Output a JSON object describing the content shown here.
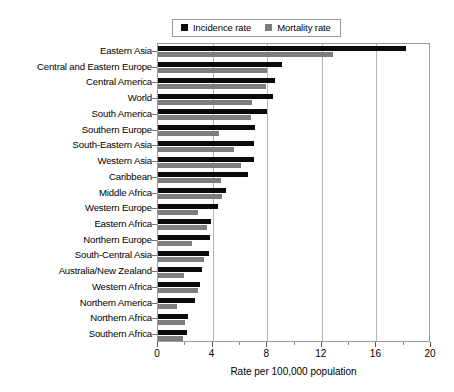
{
  "legend": {
    "position": "top-center",
    "entries": [
      {
        "label": "Incidence rate",
        "color": "#0a0a0a",
        "icon": "square-swatch"
      },
      {
        "label": "Mortality rate",
        "color": "#7d7d7d",
        "icon": "square-swatch"
      }
    ]
  },
  "axis": {
    "x_title": "Rate per 100,000 population",
    "tick_labels": [
      "0",
      "4",
      "8",
      "12",
      "16",
      "20"
    ],
    "tick_values": [
      0,
      4,
      8,
      12,
      16,
      20
    ],
    "minor_tick_values": [
      2,
      6,
      10,
      14,
      18
    ],
    "xmin": 0,
    "xmax": 20
  },
  "chart_data": {
    "type": "bar",
    "orientation": "horizontal",
    "title": "",
    "xlabel": "Rate per 100,000 population",
    "ylabel": "",
    "xlim": [
      0,
      20
    ],
    "grid": true,
    "grid_axis": "x",
    "legend_position": "top-center",
    "categories": [
      "Eastern Asia",
      "Central and Eastern Europe",
      "Central America",
      "World",
      "South America",
      "Southern Europe",
      "South-Eastern Asia",
      "Western Asia",
      "Caribbean",
      "Middle Africa",
      "Western Europe",
      "Eastern Africa",
      "Northern Europe",
      "South-Central Asia",
      "Australia/New Zealand",
      "Western Africa",
      "Northern America",
      "Northern Africa",
      "Southern Africa"
    ],
    "series": [
      {
        "name": "Incidence rate",
        "color": "#0a0a0a",
        "values": [
          18.2,
          9.1,
          8.6,
          8.4,
          8.0,
          7.1,
          7.0,
          7.0,
          6.6,
          5.0,
          4.4,
          3.9,
          3.8,
          3.7,
          3.2,
          3.1,
          2.7,
          2.2,
          2.1
        ]
      },
      {
        "name": "Mortality rate",
        "color": "#7d7d7d",
        "values": [
          12.8,
          8.0,
          7.9,
          6.9,
          6.8,
          4.5,
          5.6,
          6.1,
          4.6,
          4.7,
          2.9,
          3.6,
          2.5,
          3.4,
          1.9,
          2.9,
          1.4,
          2.0,
          1.8
        ]
      }
    ]
  }
}
